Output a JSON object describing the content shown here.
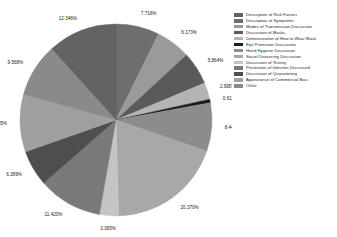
{
  "chart_data": {
    "type": "pie",
    "title": "",
    "subtitle": "",
    "xlabel": "",
    "ylabel": "",
    "grid": false,
    "legend_position": "right",
    "value_suffix": "%",
    "background": "#ffffff",
    "categories": [
      "Description of Risk Factors",
      "Description of Symptoms",
      "Modes of Transmission Discussion",
      "Discussion of Masks",
      "Demonstration of How to Wear Mask",
      "Eye Protection Discussion",
      "Hand Hygiene Discussion",
      "Social Distancing Discussion",
      "Discussion of Testing",
      "Prevention of Infection Discussed",
      "Discussion of Quarantining",
      "Appearance of Commercial Bias",
      "Other"
    ],
    "values": [
      7.716,
      6.173,
      5.864,
      2.995,
      0.617,
      8.642,
      20.37,
      3.395,
      11.42,
      6.389,
      10.185,
      9.568,
      12.346
    ],
    "labels": [
      "7.716%",
      "6.173%",
      "5.864%",
      "2.995%",
      "0.617%",
      "8.442%",
      "20.370%",
      "3.395%",
      "11.420%",
      "6.389%",
      "10.185%",
      "9.568%",
      "12.346%"
    ],
    "colors": [
      "#6e6e6e",
      "#9a9a9a",
      "#5a5a5a",
      "#b4b4b4",
      "#1d1d1d",
      "#8c8c8c",
      "#a8a8a8",
      "#c4c4c4",
      "#7a7a7a",
      "#4e4e4e",
      "#9f9f9f",
      "#8a8a8a",
      "#636363"
    ],
    "legend_colors": [
      "#636363",
      "#6e6e6e",
      "#9a9a9a",
      "#5a5a5a",
      "#b4b4b4",
      "#1d1d1d",
      "#8c8c8c",
      "#a8a8a8",
      "#c4c4c4",
      "#7a7a7a",
      "#4e4e4e",
      "#9f9f9f",
      "#8a8a8a",
      "#636363"
    ],
    "legend_entries": [
      "Description of Risk Factors",
      "Description of Symptoms",
      "Modes of Transmission Discussion",
      "Discussion of Masks",
      "Demonstration of How to Wear Mask",
      "Eye Protection Discussion",
      "Hand Hygiene Discussion",
      "Social Distancing Discussion",
      "Discussion of Testing",
      "Prevention of Infection Discussed",
      "Discussion of Quarantining",
      "Appearance of Commercial Bias",
      "Other"
    ]
  }
}
